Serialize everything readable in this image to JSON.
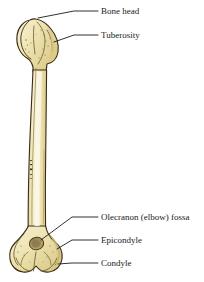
{
  "figure": {
    "background_color": "#ffffff",
    "bone": {
      "name": "humerus",
      "fill_color": "#efe5b4",
      "highlight_color": "#f8f2d6",
      "shade_color": "#ddd08f",
      "outline_color": "#3a2a12",
      "fossa_color": "#b9a775",
      "fossa_dark_color": "#8c7a4c"
    },
    "leader_color": "#1a1a1a"
  },
  "labels": [
    {
      "id": "bone-head",
      "text": "Bone head",
      "x": 84,
      "y": 11,
      "leader": "M38,18 L74,11 L98,11"
    },
    {
      "id": "tuberosity",
      "text": "Tuberosity",
      "x": 84,
      "y": 34,
      "leader": "M54,42 L74,35 L98,35"
    },
    {
      "id": "olecranon-fossa",
      "text": "Olecranon (elbow) fossa",
      "x": 84,
      "y": 216,
      "leader": "M48,240 L72,217 L98,217"
    },
    {
      "id": "epicondyle",
      "text": "Epicondyle",
      "x": 84,
      "y": 239,
      "leader": "M57,249 L72,240 L98,240"
    },
    {
      "id": "condyle",
      "text": "Condyle",
      "x": 84,
      "y": 262,
      "leader": "M58,264 L72,263 L98,263"
    }
  ]
}
